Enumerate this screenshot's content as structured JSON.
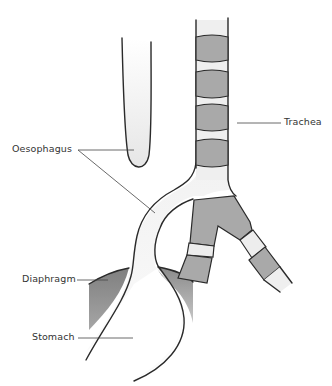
{
  "figure": {
    "labels": {
      "oesophagus": "Oesophagus",
      "trachea": "Trachea",
      "diaphragm": "Diaphragm",
      "stomach": "Stomach"
    },
    "colors": {
      "lumen": "#ececec",
      "cartilage": "#a9a9a9",
      "diaphragm": "#8f8f8f",
      "outline": "#2a2a2a"
    }
  }
}
